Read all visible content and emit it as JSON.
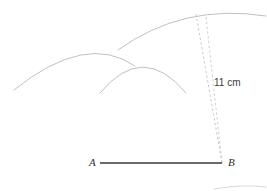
{
  "diagram": {
    "background_color": "#ffffff",
    "width": 267,
    "height": 191,
    "labels": {
      "point_a": "A",
      "point_b": "B",
      "dimension": "11 cm"
    },
    "colors": {
      "segment": "#6a6a6a",
      "arc": "#b9b9bd",
      "dashed": "#c2c2c6",
      "text": "#303030"
    },
    "segment": {
      "name": "segment-ab",
      "x1": 100,
      "y1": 163,
      "x2": 222,
      "y2": 163,
      "stroke_width": 2.2
    },
    "arcs": [
      {
        "name": "arc-left",
        "description": "arc centred right of A sweeping over the left of the figure",
        "path": "M 14 90 Q 86 32 135 66",
        "stroke_width": 0.9
      },
      {
        "name": "arc-middle",
        "description": "arc centred near A meeting the left arc at the upper intersection",
        "path": "M 100 93 Q 143 41 186 93",
        "stroke_width": 0.9
      },
      {
        "name": "arc-large-right",
        "description": "large arc of radius 11 cm centred at B passing through the top right",
        "path": "M 118 50 Q 183 3 266 16",
        "stroke_width": 0.9
      },
      {
        "name": "arc-bottom-right-fragment",
        "description": "faint arc fragment clipped at the bottom right edge",
        "path": "M 214 189 Q 243 184 266 187",
        "stroke_width": 0.9
      }
    ],
    "dashed_lines": [
      {
        "name": "radius-line-outer",
        "x1": 196,
        "y1": 14,
        "x2": 222,
        "y2": 163
      },
      {
        "name": "radius-line-inner",
        "x1": 206,
        "y1": 17,
        "x2": 222,
        "y2": 163
      }
    ],
    "label_positions": {
      "point_a": {
        "x": 89,
        "y": 157
      },
      "point_b": {
        "x": 228,
        "y": 157
      },
      "dimension": {
        "x": 214,
        "y": 78
      }
    }
  }
}
